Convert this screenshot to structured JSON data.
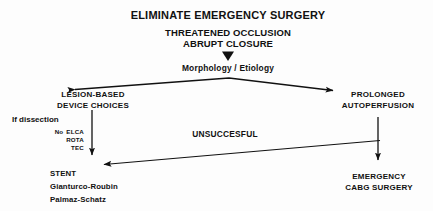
{
  "diagram": {
    "type": "flowchart",
    "title": "ELIMINATE EMERGENCY SURGERY",
    "problem": {
      "line1": "THREATENED OCCLUSION",
      "line2": "ABRUPT CLOSURE"
    },
    "decision": "Morphology / Etiology",
    "branch_left": {
      "line1": "LESION-BASED",
      "line2": "DEVICE CHOICES",
      "condition": "If dissection",
      "devices": [
        {
          "prefix": "No",
          "name": "ELCA"
        },
        {
          "prefix": "",
          "name": "ROTA"
        },
        {
          "prefix": "",
          "name": "TEC"
        }
      ]
    },
    "branch_right": {
      "line1": "PROLONGED",
      "line2": "AUTOPERFUSION"
    },
    "failure_label": "UNSUCCESFUL",
    "outcome_left": {
      "line1": "STENT",
      "line2": "Gianturco-Roubin",
      "line3": "Palmaz-Schatz"
    },
    "outcome_right": {
      "line1": "EMERGENCY",
      "line2": "CABG SURGERY"
    },
    "colors": {
      "ink": "#111111",
      "background": "#fdfdfd"
    }
  }
}
